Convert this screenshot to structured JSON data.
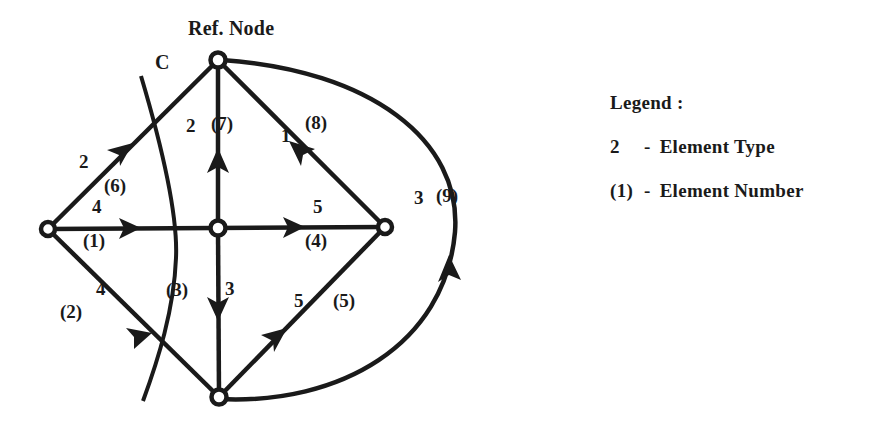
{
  "figure": {
    "title_label": "Ref. Node",
    "cut_label": "C",
    "background_color": "#ffffff",
    "ink_color": "#1a1a1a"
  },
  "nodes": [
    {
      "id": "ref",
      "name": "reference-node",
      "x": 218,
      "y": 60,
      "label": "Ref. Node"
    },
    {
      "id": "left",
      "name": "left-node",
      "x": 48,
      "y": 229,
      "label": ""
    },
    {
      "id": "center",
      "name": "center-node",
      "x": 218,
      "y": 228,
      "label": ""
    },
    {
      "id": "right",
      "name": "right-node",
      "x": 385,
      "y": 227,
      "label": ""
    },
    {
      "id": "bottom",
      "name": "bottom-node",
      "x": 219,
      "y": 397,
      "label": ""
    }
  ],
  "elements": [
    {
      "number": "(1)",
      "type": "4",
      "from": "left",
      "to": "center",
      "shape": "line",
      "name": "element-1-left-to-center"
    },
    {
      "number": "(2)",
      "type": "4",
      "from": "left",
      "to": "bottom",
      "shape": "line",
      "name": "element-2-left-to-bottom"
    },
    {
      "number": "(3)",
      "type": "3",
      "from": "center",
      "to": "bottom",
      "shape": "line",
      "name": "element-3-center-to-bottom"
    },
    {
      "number": "(4)",
      "type": "5",
      "from": "center",
      "to": "right",
      "shape": "line",
      "name": "element-4-center-to-right"
    },
    {
      "number": "(5)",
      "type": "5",
      "from": "bottom",
      "to": "right",
      "shape": "line",
      "name": "element-5-bottom-to-right"
    },
    {
      "number": "(6)",
      "type": "2",
      "from": "left",
      "to": "ref",
      "shape": "line",
      "name": "element-6-left-to-ref"
    },
    {
      "number": "(7)",
      "type": "2",
      "from": "center",
      "to": "ref",
      "shape": "line",
      "name": "element-7-center-to-ref"
    },
    {
      "number": "(8)",
      "type": "1",
      "from": "right",
      "to": "ref",
      "shape": "line",
      "name": "element-8-right-to-ref"
    },
    {
      "number": "(9)",
      "type": "3",
      "from": "bottom",
      "to": "ref",
      "shape": "arc",
      "name": "element-9-bottom-to-ref"
    }
  ],
  "edge_labels": {
    "e1_type": {
      "text": "4",
      "x": 97,
      "y": 206
    },
    "e1_number": {
      "text": "(1)",
      "x": 90,
      "y": 240
    },
    "e2_type": {
      "text": "4",
      "x": 100,
      "y": 288
    },
    "e2_number": {
      "text": "(2)",
      "x": 65,
      "y": 311
    },
    "e3_number": {
      "text": "(3)",
      "x": 172,
      "y": 289
    },
    "e3_type": {
      "text": "3",
      "x": 228,
      "y": 288
    },
    "e4_type": {
      "text": "5",
      "x": 318,
      "y": 206
    },
    "e4_number": {
      "text": "(4)",
      "x": 312,
      "y": 240
    },
    "e5_type": {
      "text": "5",
      "x": 298,
      "y": 300
    },
    "e5_number": {
      "text": "(5)",
      "x": 340,
      "y": 300
    },
    "e6_type": {
      "text": "2",
      "x": 78,
      "y": 160
    },
    "e6_number": {
      "text": "(6)",
      "x": 110,
      "y": 185
    },
    "e7_type": {
      "text": "2",
      "x": 193,
      "y": 125
    },
    "e7_number": {
      "text": "(7)",
      "x": 219,
      "y": 123
    },
    "e8_type": {
      "text": "1",
      "x": 285,
      "y": 135
    },
    "e8_number": {
      "text": "(8)",
      "x": 313,
      "y": 123
    },
    "e9_type": {
      "text": "3",
      "x": 418,
      "y": 197
    },
    "e9_number": {
      "text": "(9)",
      "x": 441,
      "y": 195
    },
    "cut_c": {
      "text": "C",
      "x": 155,
      "y": 60
    }
  },
  "legend": {
    "heading": "Legend :",
    "rows": [
      {
        "key": "2",
        "dash": "-",
        "description": "Element Type"
      },
      {
        "key": "(1)",
        "dash": "-",
        "description": "Element Number"
      }
    ]
  }
}
